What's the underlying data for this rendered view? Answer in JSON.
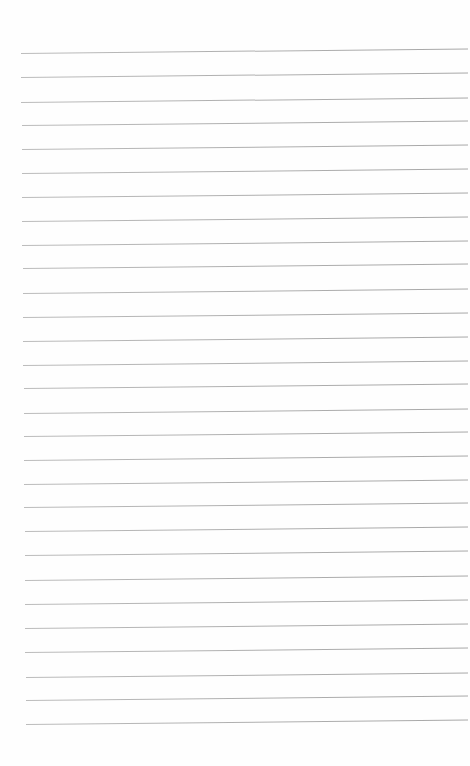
{
  "page": {
    "type": "lined-paper",
    "background_color": "#fefefe",
    "line_color": "#a8a8a8",
    "line_count": 29,
    "line_spacing_px": 24,
    "lines_left_y": [
      53,
      77,
      102,
      125,
      149,
      173,
      197,
      221,
      245,
      268,
      293,
      317,
      341,
      365,
      388,
      413,
      436,
      460,
      484,
      507,
      531,
      555,
      580,
      604,
      628,
      652,
      677,
      700,
      724
    ],
    "line_start_x": 21,
    "line_end_x": 468,
    "line_tilt_deg": -0.58
  }
}
